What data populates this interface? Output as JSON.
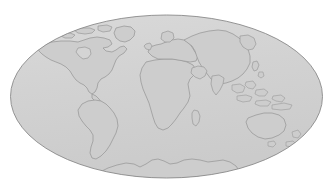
{
  "figure": {
    "kind": "world-map",
    "projection": "Mollweide (elliptical equal-area)"
  },
  "canvas": {
    "width": 333,
    "height": 193,
    "background_color": "#ffffff"
  },
  "globe": {
    "center_x": 166.5,
    "center_y": 96.5,
    "radius_x": 156,
    "radius_y": 81.5,
    "ocean_fill": "#d2d2d2",
    "ocean_fill_light": "#d8d8d8",
    "outline_color": "#8a8a8a",
    "outline_width": 0.9
  },
  "land": {
    "fill": "#cdcdcd",
    "stroke": "#9a9a9a",
    "stroke_width": 0.8,
    "label": "Landmasses"
  },
  "regions": [
    {
      "name": "north-america",
      "label": "North America"
    },
    {
      "name": "greenland",
      "label": "Greenland"
    },
    {
      "name": "arctic-islands",
      "label": "Canadian Arctic Islands"
    },
    {
      "name": "south-america",
      "label": "South America"
    },
    {
      "name": "africa",
      "label": "Africa"
    },
    {
      "name": "madagascar",
      "label": "Madagascar"
    },
    {
      "name": "europe",
      "label": "Europe"
    },
    {
      "name": "asia",
      "label": "Asia"
    },
    {
      "name": "india",
      "label": "India"
    },
    {
      "name": "southeast-asia-islands",
      "label": "Southeast Asian Archipelago"
    },
    {
      "name": "japan",
      "label": "Japan"
    },
    {
      "name": "australia",
      "label": "Australia"
    },
    {
      "name": "new-zealand",
      "label": "New Zealand"
    },
    {
      "name": "antarctica",
      "label": "Antarctica"
    },
    {
      "name": "british-isles",
      "label": "British Isles"
    }
  ],
  "watermark": {
    "text": "",
    "color": "#ededed"
  }
}
